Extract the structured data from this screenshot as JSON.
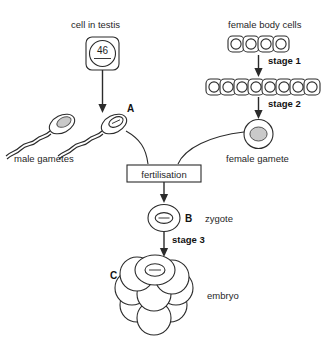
{
  "diagram": {
    "title_labels": {
      "cell_in_testis": "cell in testis",
      "female_body_cells": "female body cells",
      "male_gametes": "male gametes",
      "female_gamete": "female gamete",
      "fertilisation": "fertilisation",
      "zygote": "zygote",
      "embryo": "embryo"
    },
    "stage_labels": {
      "stage1": "stage 1",
      "stage2": "stage 2",
      "stage3": "stage 3"
    },
    "letters": {
      "a": "A",
      "b": "B",
      "c": "C"
    },
    "chromosome_number": "46",
    "counts": {
      "female_body_cells_row1": 4,
      "female_body_cells_row2": 8,
      "male_gametes": 2,
      "embryo_cells": 8
    },
    "colors": {
      "stroke": "#2b2b2b",
      "nucleus_fill": "#c9c9c9",
      "background": "#ffffff",
      "text": "#1f1f1f"
    }
  }
}
